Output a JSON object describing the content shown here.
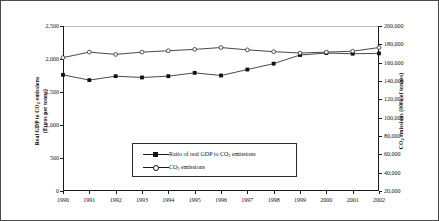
{
  "chart_data": {
    "type": "line",
    "title": "",
    "xlabel": "",
    "categories": [
      "1990",
      "1991",
      "1992",
      "1993",
      "1994",
      "1995",
      "1996",
      "1997",
      "1998",
      "1999",
      "2000",
      "2001",
      "2002"
    ],
    "grid": false,
    "legend_position": "inside-bottom-center",
    "axes": {
      "left": {
        "label_line1": "Real GDP to CO2 emissions",
        "label_line2": "(Euros per tonne)",
        "ticks": [
          "0",
          "500",
          "1,000",
          "1,500",
          "2,000",
          "2,500"
        ],
        "tick_values": [
          0,
          500,
          1000,
          1500,
          2000,
          2500
        ],
        "min": 0,
        "max": 2500
      },
      "right": {
        "label_line1": "CO2 emissions (000s of tonnes)",
        "ticks": [
          "20,000",
          "40,000",
          "60,000",
          "80,000",
          "100,000",
          "120,000",
          "140,000",
          "160,000",
          "180,000",
          "200,000"
        ],
        "tick_values": [
          20000,
          40000,
          60000,
          80000,
          100000,
          120000,
          140000,
          160000,
          180000,
          200000
        ],
        "min": 20000,
        "max": 200000
      }
    },
    "series": [
      {
        "name": "Ratio of real GDP to CO2 emissions",
        "axis": "left",
        "marker": "filled-square",
        "values": [
          1760,
          1680,
          1740,
          1720,
          1740,
          1790,
          1750,
          1840,
          1930,
          2060,
          2090,
          2080,
          2085
        ]
      },
      {
        "name": "CO2 emissions",
        "axis": "right",
        "marker": "open-circle",
        "values": [
          165500,
          171500,
          169000,
          171500,
          173000,
          174500,
          176500,
          174000,
          172000,
          170500,
          171500,
          172500,
          176500
        ]
      }
    ]
  },
  "legend": {
    "items": [
      {
        "label": "Ratio of real GDP to CO2 emissions",
        "marker": "filled-square"
      },
      {
        "label": "CO2 emissions",
        "marker": "open-circle"
      }
    ]
  }
}
